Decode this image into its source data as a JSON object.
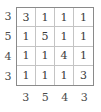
{
  "puzzle": {
    "type": "numeric-grid",
    "rows": 4,
    "columns": 4,
    "row_labels": [
      "3",
      "5",
      "4",
      "3"
    ],
    "column_labels": [
      "3",
      "5",
      "4",
      "3"
    ],
    "grid": [
      [
        "3",
        "1",
        "1",
        "1"
      ],
      [
        "1",
        "5",
        "1",
        "1"
      ],
      [
        "1",
        "1",
        "4",
        "1"
      ],
      [
        "1",
        "1",
        "1",
        "3"
      ]
    ],
    "colors": {
      "background": "#ffffff",
      "outer_border": "#8a8a8a",
      "inner_gridline": "#c4c4c4",
      "cell_text": "#3a3a3a",
      "label_text": "#4a4a4a"
    }
  }
}
